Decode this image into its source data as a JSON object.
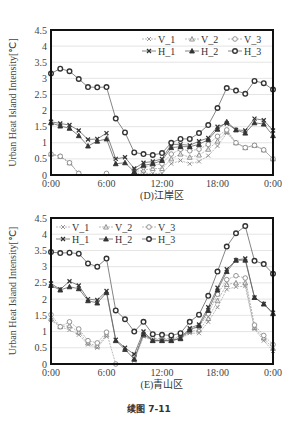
{
  "figure_caption": "续图 7-11",
  "chart_data": [
    {
      "type": "line",
      "title": "(D)江岸区",
      "xlabel": "",
      "ylabel": "Urban Heat Island Intensity[℃]",
      "ylim": [
        0,
        4.5
      ],
      "yticks": [
        "0",
        "0.5",
        "1",
        "1.5",
        "2",
        "2.5",
        "3",
        "3.5",
        "4",
        "4.5"
      ],
      "xticks": [
        "0:00",
        "6:00",
        "12:00",
        "18:00",
        "0:00"
      ],
      "grid": true,
      "legend_position": "top-right",
      "x": [
        0,
        1,
        2,
        3,
        4,
        5,
        6,
        7,
        8,
        9,
        10,
        11,
        12,
        13,
        14,
        15,
        16,
        17,
        18,
        19,
        20,
        21,
        22,
        23,
        24
      ],
      "series": [
        {
          "name": "V_1",
          "marker": "x",
          "style": "light",
          "values": [
            0.65,
            0.58,
            0.38,
            0.05,
            null,
            null,
            null,
            null,
            null,
            0.05,
            0.05,
            0.05,
            0.05,
            0.35,
            0.45,
            0.35,
            0.42,
            0.6,
            0.9,
            1.3,
            1.0,
            0.85,
            0.92,
            0.78,
            0.5
          ]
        },
        {
          "name": "V_2",
          "marker": "triangle",
          "style": "light",
          "values": [
            0.65,
            0.58,
            0.38,
            0.05,
            null,
            null,
            null,
            null,
            null,
            0.1,
            0.15,
            0.2,
            0.2,
            0.5,
            0.65,
            0.55,
            0.62,
            0.8,
            1.05,
            1.35,
            1.0,
            0.85,
            0.92,
            0.78,
            0.5
          ]
        },
        {
          "name": "V_3",
          "marker": "circle",
          "style": "light",
          "values": [
            0.65,
            0.58,
            0.38,
            0.05,
            null,
            null,
            0.05,
            null,
            null,
            0.15,
            0.25,
            0.3,
            0.35,
            0.65,
            0.8,
            0.75,
            0.8,
            0.95,
            1.2,
            1.4,
            1.0,
            0.85,
            0.92,
            0.78,
            0.5
          ]
        },
        {
          "name": "H_1",
          "marker": "x",
          "style": "dark",
          "values": [
            1.65,
            1.6,
            1.55,
            1.38,
            1.1,
            1.12,
            1.3,
            0.5,
            0.55,
            0.2,
            0.38,
            0.42,
            0.5,
            0.95,
            0.95,
            0.92,
            1.05,
            1.15,
            1.5,
            1.6,
            1.4,
            1.38,
            1.75,
            1.7,
            1.38
          ]
        },
        {
          "name": "H_2",
          "marker": "triangle",
          "style": "dark",
          "values": [
            1.62,
            1.52,
            1.45,
            1.22,
            0.9,
            1.05,
            1.12,
            0.35,
            0.38,
            0.1,
            0.3,
            0.35,
            0.45,
            0.85,
            0.88,
            0.88,
            0.95,
            1.1,
            1.42,
            1.65,
            1.4,
            1.3,
            1.62,
            1.58,
            1.22
          ]
        },
        {
          "name": "H_3",
          "marker": "circle",
          "style": "dark",
          "values": [
            3.15,
            3.3,
            3.22,
            2.98,
            2.73,
            2.72,
            2.73,
            1.75,
            1.32,
            0.7,
            0.65,
            0.62,
            0.68,
            1.0,
            1.12,
            1.12,
            1.3,
            1.55,
            2.08,
            2.7,
            2.62,
            2.52,
            2.92,
            2.85,
            2.65
          ]
        }
      ]
    },
    {
      "type": "line",
      "title": "(E)青山区",
      "xlabel": "",
      "ylabel": "Urban Heat Island Intensity[℃]",
      "ylim": [
        0,
        4.5
      ],
      "yticks": [
        "0",
        "0.5",
        "1",
        "1.5",
        "2",
        "2.5",
        "3",
        "3.5",
        "4",
        "4.5"
      ],
      "xticks": [
        "0:00",
        "6:00",
        "12:00",
        "18:00",
        "0:00"
      ],
      "grid": true,
      "legend_position": "top-left",
      "x": [
        0,
        1,
        2,
        3,
        4,
        5,
        6,
        7,
        8,
        9,
        10,
        11,
        12,
        13,
        14,
        15,
        16,
        17,
        18,
        19,
        20,
        21,
        22,
        23,
        24
      ],
      "series": [
        {
          "name": "V_1",
          "marker": "x",
          "style": "light",
          "values": [
            1.35,
            1.15,
            1.05,
            0.9,
            0.6,
            0.5,
            0.85,
            null,
            null,
            0.1,
            0.85,
            0.72,
            0.72,
            0.72,
            0.78,
            0.95,
            0.95,
            1.3,
            1.75,
            2.3,
            2.38,
            2.4,
            1.08,
            0.72,
            0.4
          ]
        },
        {
          "name": "V_2",
          "marker": "triangle",
          "style": "light",
          "values": [
            1.4,
            1.15,
            1.18,
            0.98,
            0.65,
            0.55,
            0.9,
            null,
            null,
            0.15,
            0.88,
            0.75,
            0.75,
            0.75,
            0.8,
            1.0,
            1.05,
            1.4,
            1.95,
            2.45,
            2.5,
            2.5,
            1.12,
            0.8,
            0.48
          ]
        },
        {
          "name": "V_3",
          "marker": "circle",
          "style": "light",
          "values": [
            1.52,
            1.15,
            1.3,
            1.08,
            0.72,
            0.65,
            0.98,
            0.0,
            null,
            0.25,
            0.92,
            0.78,
            0.78,
            0.78,
            0.85,
            1.05,
            1.15,
            1.55,
            2.15,
            2.6,
            2.72,
            2.65,
            1.2,
            0.88,
            0.6
          ]
        },
        {
          "name": "H_1",
          "marker": "x",
          "style": "dark",
          "values": [
            2.48,
            2.3,
            2.55,
            2.42,
            2.0,
            1.97,
            2.25,
            0.75,
            0.5,
            0.3,
            1.0,
            0.72,
            0.72,
            0.72,
            0.8,
            1.1,
            1.22,
            1.75,
            2.35,
            2.92,
            3.2,
            3.25,
            2.05,
            1.85,
            1.58
          ]
        },
        {
          "name": "H_2",
          "marker": "triangle",
          "style": "dark",
          "values": [
            2.42,
            2.28,
            2.38,
            2.32,
            1.95,
            1.88,
            2.2,
            0.72,
            0.45,
            0.15,
            0.92,
            0.72,
            0.72,
            0.72,
            0.78,
            1.05,
            1.18,
            1.65,
            2.28,
            2.85,
            3.2,
            3.2,
            2.05,
            1.85,
            1.55
          ]
        },
        {
          "name": "H_3",
          "marker": "circle",
          "style": "dark",
          "values": [
            3.45,
            3.42,
            3.43,
            3.4,
            3.1,
            3.0,
            3.25,
            1.65,
            1.38,
            1.0,
            1.3,
            0.92,
            0.9,
            0.88,
            0.95,
            1.3,
            1.52,
            2.1,
            2.85,
            3.62,
            4.03,
            4.25,
            3.18,
            3.08,
            2.78
          ]
        }
      ]
    }
  ]
}
